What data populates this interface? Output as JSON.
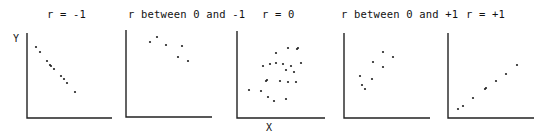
{
  "chart_data": [
    {
      "type": "scatter",
      "title": "r = -1",
      "xlabel": "",
      "ylabel": "Y",
      "grid": false,
      "legend": null,
      "axes_box": {
        "left": 27,
        "top": 33,
        "right": 112,
        "bottom": 118
      },
      "points": [
        [
          36,
          47
        ],
        [
          40,
          52
        ],
        [
          47,
          61
        ],
        [
          50,
          65
        ],
        [
          51,
          66
        ],
        [
          54,
          69
        ],
        [
          61,
          76
        ],
        [
          64,
          79
        ],
        [
          67,
          83
        ],
        [
          75,
          92
        ]
      ]
    },
    {
      "type": "scatter",
      "title": "r between 0 and -1",
      "xlabel": "",
      "ylabel": "",
      "grid": false,
      "legend": null,
      "axes_box": {
        "left": 126,
        "top": 30,
        "right": 212,
        "bottom": 117
      },
      "points": [
        [
          157,
          37
        ],
        [
          150,
          42
        ],
        [
          166,
          45
        ],
        [
          182,
          46
        ],
        [
          178,
          57
        ],
        [
          188,
          61
        ]
      ]
    },
    {
      "type": "scatter",
      "title": "r = 0",
      "xlabel": "X",
      "ylabel": "",
      "grid": false,
      "legend": null,
      "axes_box": {
        "left": 237,
        "top": 31,
        "right": 325,
        "bottom": 118
      },
      "points": [
        [
          276,
          53
        ],
        [
          288,
          48
        ],
        [
          298,
          48
        ],
        [
          297,
          49
        ],
        [
          263,
          66
        ],
        [
          270,
          64
        ],
        [
          276,
          63
        ],
        [
          283,
          64
        ],
        [
          291,
          66
        ],
        [
          286,
          70
        ],
        [
          301,
          63
        ],
        [
          294,
          72
        ],
        [
          249,
          90
        ],
        [
          261,
          91
        ],
        [
          266,
          81
        ],
        [
          267,
          80
        ],
        [
          280,
          81
        ],
        [
          288,
          82
        ],
        [
          296,
          82
        ],
        [
          268,
          97
        ],
        [
          274,
          101
        ],
        [
          286,
          99
        ]
      ]
    },
    {
      "type": "scatter",
      "title": "r between 0 and +1",
      "xlabel": "",
      "ylabel": "",
      "grid": false,
      "legend": null,
      "axes_box": {
        "left": 344,
        "top": 33,
        "right": 430,
        "bottom": 118
      },
      "points": [
        [
          383,
          52
        ],
        [
          393,
          57
        ],
        [
          373,
          62
        ],
        [
          383,
          67
        ],
        [
          360,
          76
        ],
        [
          372,
          79
        ],
        [
          362,
          85
        ],
        [
          365,
          89
        ]
      ]
    },
    {
      "type": "scatter",
      "title": "r = +1",
      "xlabel": "",
      "ylabel": "",
      "grid": false,
      "legend": null,
      "axes_box": {
        "left": 448,
        "top": 33,
        "right": 534,
        "bottom": 118
      },
      "points": [
        [
          458,
          109
        ],
        [
          463,
          106
        ],
        [
          473,
          98
        ],
        [
          485,
          89
        ],
        [
          486,
          88
        ],
        [
          496,
          81
        ],
        [
          506,
          74
        ],
        [
          517,
          65
        ]
      ]
    }
  ]
}
